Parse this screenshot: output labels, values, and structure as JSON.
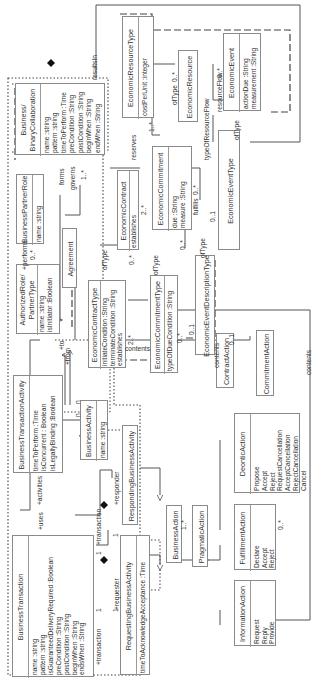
{
  "diagram": {
    "type": "UML class diagram (rotated 90°)",
    "classes": {
      "economic_resource_type": {
        "name": "EconomicResourceType",
        "attributes": [
          "costPerUnit :integer"
        ]
      },
      "economic_resource": {
        "name": "EconomicResource",
        "attributes": []
      },
      "economic_event": {
        "name": "EconomicEvent",
        "attributes": [
          "actionDue :String",
          "measurement :String"
        ]
      },
      "binary_collaboration": {
        "name": "Business/\nBinaryCollaboration",
        "attributes": [
          "name :string",
          "pattern :string",
          "timeToPerform :Time",
          "preCondition :String",
          "postCondition :String",
          "beginWhen :String",
          "endWhen :String"
        ]
      },
      "business_partner_role": {
        "name": "BusinessPartnerRole",
        "attributes": [
          "name :string"
        ]
      },
      "agreement": {
        "name": "Agreement",
        "attributes": []
      },
      "economic_contract": {
        "name": "EconomicContract",
        "attributes": [
          "establishes"
        ]
      },
      "economic_commitment": {
        "name": "EconomicCommitment",
        "attributes": [
          "due :String",
          "measure :String"
        ]
      },
      "economic_event_type": {
        "name": "EconomicEventType",
        "attributes": []
      },
      "authorized_role": {
        "name": "AuthorizedRole/\nPartnerType",
        "attributes": [
          "name :string",
          "isInitiator :Boolean"
        ]
      },
      "economic_contract_type": {
        "name": "EconomicContractType",
        "attributes": [
          "initiateCondition :String",
          "terminateCondition :String",
          "establishes"
        ]
      },
      "economic_commitment_type": {
        "name": "EconomicCommitmentType",
        "attributes": [
          "typeOfDueCondition :String"
        ]
      },
      "economic_event_description_type": {
        "name": "EconomicEventDescriptionType",
        "attributes": []
      },
      "business_transaction_activity": {
        "name": "BusinessTransactionActivity",
        "attributes": [
          "timeToPerform :Time",
          "isConcurrent : Boolean",
          "isLegallyBinding :Boolean"
        ]
      },
      "business_activity": {
        "name": "BusinessActivity",
        "attributes": [
          "name :string"
        ]
      },
      "contract_action": {
        "name": "ContractAction",
        "attributes": []
      },
      "commitment_action": {
        "name": "CommitmentAction",
        "attributes": []
      },
      "deontic_action": {
        "name": "DeonticAction",
        "attributes": [
          "Propose",
          "Accept",
          "Reject",
          "RequestCancellation",
          "AcceptCancellation",
          "RejectCancellation",
          "Cancel"
        ]
      },
      "responding_business_activity": {
        "name": "RespondingBusinessActivity",
        "attributes": []
      },
      "business_transaction": {
        "name": "BusinessTransaction",
        "attributes": [
          "name :string",
          "pattern :string",
          "isGuaranteedDeliveryRequired :Boolean",
          "preCondition :String",
          "postCondition :String",
          "beginWhen :String",
          "endsWhen :String"
        ]
      },
      "requesting_business_activity": {
        "name": "RequestingBusinessActivity",
        "attributes": [
          "timeToAcknowledgeAcceptance :Time"
        ]
      },
      "business_action": {
        "name": "BusinessAction",
        "attributes": []
      },
      "pragmatic_action": {
        "name": "PragmaticAction",
        "attributes": []
      },
      "fulfillment_action": {
        "name": "FulfillmentAction",
        "attributes": [
          "Declare",
          "Accept",
          "Reject"
        ]
      },
      "information_action": {
        "name": "InformationAction",
        "attributes": [
          "Request",
          "Reply",
          "Provide"
        ]
      }
    },
    "labels": {
      "results_in": "resultsIn",
      "reserves": "reserves",
      "of_type_top": "ofType",
      "of_type_top_mult": "0..*",
      "resource_flow": "resourceFlow",
      "resource_flow_mult": "0..*",
      "type_of_resource_flow": "typeOfResourceFlow",
      "of_type_event": "ofType",
      "mult_1star": "1..*",
      "forms": "forms",
      "governs": "governs",
      "governs_mult": "1..*",
      "performs": "+performs",
      "performs_mult": "0..*",
      "performs_mult2": "0..*",
      "fulfills": "fulfills",
      "fulfills_mult": "0..*",
      "mult_01_a": "0..1",
      "mult_2star_a": "2..*",
      "mult_2star_b": "2..*",
      "mult_0star_a": "0..*",
      "mult_0star_b": "0..*",
      "mult_0star_c": "0..*",
      "mult_01_b": "0..1",
      "mult_01_c": "0..1",
      "of_type_contract": "ofType",
      "of_type_commitment": "ofType",
      "of_type_desc": "ofType",
      "contents_a": "contents",
      "contents_b": "contents",
      "contents_c": "contents",
      "to": "+to",
      "from": "+from",
      "activities": "+activities",
      "uses": "+uses",
      "n1": "n",
      "n2": "n",
      "transaction1": "+transaction",
      "transaction2": "+transaction",
      "responder": "+responder",
      "requester": "+requester",
      "one_a": "1",
      "one_b": "1",
      "one_c": "1",
      "one_d": "1",
      "mult_1star_ba": "1..*",
      "mult_0dot_fa": "0..*"
    }
  }
}
